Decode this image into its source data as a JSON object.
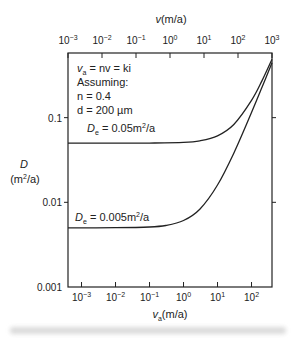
{
  "chart_data": {
    "type": "line",
    "title": "",
    "xlabel": "v_a(m/a)",
    "x2label": "v(m/a)",
    "ylabel": "D",
    "ylabel_units": "(m²/a)",
    "xscale": "log",
    "yscale": "log",
    "xlim": [
      0.0004,
      400
    ],
    "ylim": [
      0.001,
      0.58
    ],
    "x_ticks": [
      {
        "value": 0.001,
        "base": "10",
        "exp": "−3"
      },
      {
        "value": 0.01,
        "base": "10",
        "exp": "−2"
      },
      {
        "value": 0.1,
        "base": "10",
        "exp": "−1"
      },
      {
        "value": 1,
        "base": "10",
        "exp": "0"
      },
      {
        "value": 10,
        "base": "10",
        "exp": "1"
      },
      {
        "value": 100,
        "base": "10",
        "exp": "2"
      }
    ],
    "x2_ticks": [
      {
        "value": 0.001,
        "base": "10",
        "exp": "−3"
      },
      {
        "value": 0.01,
        "base": "10",
        "exp": "−2"
      },
      {
        "value": 0.1,
        "base": "10",
        "exp": "−1"
      },
      {
        "value": 1,
        "base": "10",
        "exp": "0"
      },
      {
        "value": 10,
        "base": "10",
        "exp": "1"
      },
      {
        "value": 100,
        "base": "10",
        "exp": "2"
      },
      {
        "value": 1000,
        "base": "10",
        "exp": "3"
      }
    ],
    "x2_relation": "v = v_a / n, n = 0.4",
    "y_ticks": [
      {
        "value": 0.1,
        "label": "0.1"
      },
      {
        "value": 0.01,
        "label": "0.01"
      },
      {
        "value": 0.001,
        "label": "0.001"
      }
    ],
    "series": [
      {
        "name": "De = 0.05 m²/a",
        "label_main": "D",
        "label_sub": "e",
        "label_rest": " = 0.05m",
        "label_sup": "2",
        "label_tail": "/a",
        "x": [
          0.0004,
          0.001,
          0.01,
          0.1,
          1,
          3,
          10,
          30,
          100,
          200,
          400
        ],
        "y": [
          0.05,
          0.05,
          0.05,
          0.0501,
          0.0511,
          0.0533,
          0.061,
          0.083,
          0.16,
          0.27,
          0.49
        ]
      },
      {
        "name": "De = 0.005 m²/a",
        "label_main": "D",
        "label_sub": "e",
        "label_rest": " = 0.005m",
        "label_sup": "2",
        "label_tail": "/a",
        "x": [
          0.0004,
          0.001,
          0.01,
          0.1,
          0.3,
          1,
          3,
          10,
          30,
          100,
          200,
          400
        ],
        "y": [
          0.005,
          0.005,
          0.00501,
          0.00511,
          0.00533,
          0.0061,
          0.0083,
          0.016,
          0.038,
          0.115,
          0.225,
          0.445
        ]
      }
    ],
    "annotations": {
      "line1_main": "v",
      "line1_sub": "a",
      "line1_rest": " = nv = ki",
      "line2": "Assuming:",
      "line3": "n = 0.4",
      "line4": "d = 200 µm"
    },
    "grid": false,
    "legend": "inline labels"
  }
}
